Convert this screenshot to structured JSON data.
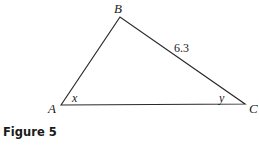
{
  "figure": {
    "caption": "Figure 5",
    "vertices": {
      "A": {
        "label": "A",
        "x": 61,
        "y": 105
      },
      "B": {
        "label": "B",
        "x": 120,
        "y": 17
      },
      "C": {
        "label": "C",
        "x": 245,
        "y": 104
      }
    },
    "angles": {
      "at_A": "x",
      "at_C": "y"
    },
    "sides": {
      "BC": "6.3"
    },
    "colors": {
      "stroke": "#2a2a2a",
      "text": "#1a1a1a",
      "background": "#ffffff"
    }
  }
}
